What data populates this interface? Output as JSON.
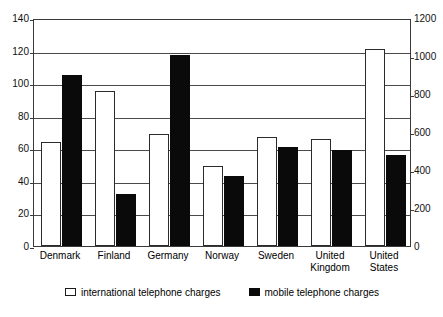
{
  "chart_data": {
    "type": "bar",
    "title": "",
    "xlabel": "",
    "ylabel": "",
    "grid": true,
    "legend_position": "bottom",
    "categories": [
      "Denmark",
      "Finland",
      "Germany",
      "Norway",
      "Sweden",
      "United\nKingdom",
      "United\nStates"
    ],
    "left_axis": {
      "ylim": [
        0,
        140
      ],
      "ticks": [
        0,
        20,
        40,
        60,
        80,
        100,
        120,
        140
      ],
      "tick_labels": [
        "0",
        "20",
        "40",
        "60",
        "80",
        "100",
        "120",
        "140"
      ]
    },
    "right_axis": {
      "ylim": [
        0,
        1200
      ],
      "ticks": [
        0,
        200,
        400,
        600,
        800,
        1000,
        1200
      ],
      "tick_labels": [
        "0",
        "200",
        "400",
        "600",
        "800",
        "1000",
        "1200"
      ]
    },
    "series": [
      {
        "name": "international telephone charges",
        "color": "#ffffff",
        "axis": "left",
        "values": [
          64,
          95,
          69,
          49,
          67,
          66,
          121
        ]
      },
      {
        "name": "mobile telephone charges",
        "color": "#0a0a0a",
        "axis": "left",
        "values": [
          105,
          32,
          117,
          43,
          61,
          59,
          56
        ]
      }
    ]
  },
  "legend": {
    "entries": [
      {
        "label": "international telephone charges",
        "swatch": "white-square-icon"
      },
      {
        "label": "mobile telephone charges",
        "swatch": "black-square-icon"
      }
    ]
  }
}
